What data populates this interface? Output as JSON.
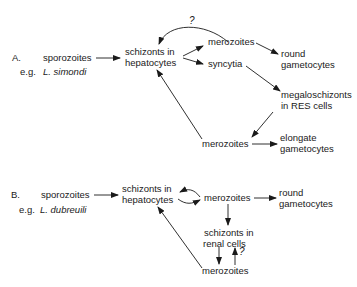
{
  "panel_a": {
    "label": "A.",
    "start": "sporozoites",
    "example_prefix": "e.g.",
    "example_species": "L. simondi",
    "schizonts_line1": "schizonts in",
    "schizonts_line2": "hepatocytes",
    "merozoites_top": "merozoites",
    "syncytia": "syncytia",
    "round_line1": "round",
    "round_line2": "gametocytes",
    "mega_line1": "megaloschizonts",
    "mega_line2": "in RES cells",
    "merozoites_bottom": "merozoites",
    "elongate_line1": "elongate",
    "elongate_line2": "gametocytes",
    "uncertain_mark": "?"
  },
  "panel_b": {
    "label": "B.",
    "start": "sporozoites",
    "example_prefix": "e.g.",
    "example_species": "L. dubreuili",
    "schizonts_line1": "schizonts in",
    "schizonts_line2": "hepatocytes",
    "merozoites_top": "merozoites",
    "round_line1": "round",
    "round_line2": "gametocytes",
    "renal_line1": "schizonts in",
    "renal_line2": "renal cells",
    "merozoites_bottom": "merozoites",
    "uncertain_mark": "?"
  },
  "colors": {
    "ink": "#1a1a1a",
    "background": "#ffffff"
  }
}
